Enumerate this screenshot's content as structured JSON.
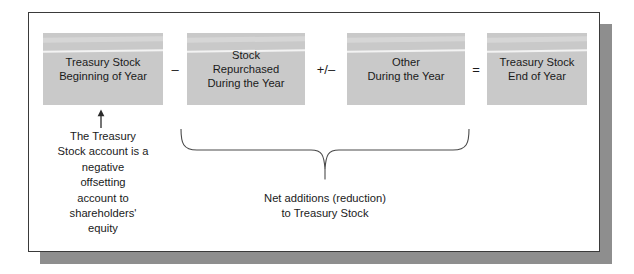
{
  "figure": {
    "boxes": [
      {
        "id": "treasury-stock-beginning",
        "text": "Treasury Stock\nBeginning of Year"
      },
      {
        "id": "stock-repurchased",
        "text": "Stock\nRepurchased\nDuring the Year"
      },
      {
        "id": "other-during-year",
        "text": "Other\nDuring the Year"
      },
      {
        "id": "treasury-stock-end",
        "text": "Treasury Stock\nEnd of Year"
      }
    ],
    "operators": [
      {
        "id": "minus",
        "symbol": "–"
      },
      {
        "id": "plus-minus",
        "symbol": "+/–"
      },
      {
        "id": "equals",
        "symbol": "="
      }
    ],
    "annotation": {
      "arrow": "arrow-up-icon",
      "text": "The Treasury\nStock account is a\nnegative\noffsetting\naccount to\nshareholders'\nequity"
    },
    "brace_caption": {
      "text": "Net additions (reduction)\nto Treasury Stock"
    },
    "colors": {
      "box_fill": "#c9c9c9",
      "text": "#1a1a1a",
      "frame_border": "#3a3a3a",
      "shadow": "#8e8e8e",
      "background": "#ffffff",
      "line": "#4a4a4a"
    }
  }
}
